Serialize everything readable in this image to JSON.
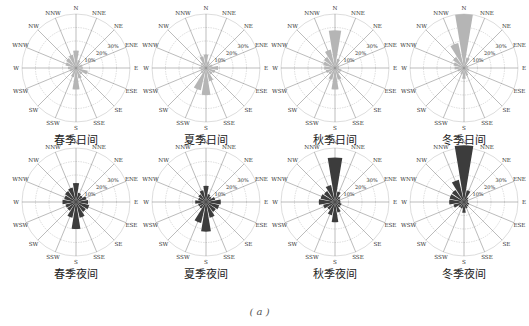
{
  "figure_label": "( a )",
  "colors": {
    "day": "#b5b5b5",
    "night": "#3c3c3c",
    "grid": "#bbbbbb",
    "axis": "#555555"
  },
  "chart_data": [
    {
      "type": "polar-bar",
      "title": "春季日间",
      "period": "day",
      "directions": [
        "N",
        "NNE",
        "NE",
        "ENE",
        "E",
        "ESE",
        "SE",
        "SSE",
        "S",
        "SSW",
        "SW",
        "WSW",
        "W",
        "WNW",
        "NW",
        "NNW"
      ],
      "values": [
        13,
        6,
        4,
        5,
        5,
        9,
        6,
        8,
        16,
        7,
        4,
        5,
        6,
        8,
        9,
        10
      ],
      "ring_labels": [
        "10%",
        "20%",
        "30%"
      ],
      "rmax": 40
    },
    {
      "type": "polar-bar",
      "title": "夏季日间",
      "period": "day",
      "directions": [
        "N",
        "NNE",
        "NE",
        "ENE",
        "E",
        "ESE",
        "SE",
        "SSE",
        "S",
        "SSW",
        "SW",
        "WSW",
        "W",
        "WNW",
        "NW",
        "NNW"
      ],
      "values": [
        10,
        5,
        4,
        5,
        9,
        7,
        6,
        10,
        20,
        17,
        5,
        4,
        5,
        4,
        5,
        9
      ],
      "ring_labels": [
        "10%",
        "20%",
        "30%"
      ],
      "rmax": 40
    },
    {
      "type": "polar-bar",
      "title": "秋季日间",
      "period": "day",
      "directions": [
        "N",
        "NNE",
        "NE",
        "ENE",
        "E",
        "ESE",
        "SE",
        "SSE",
        "S",
        "SSW",
        "SW",
        "WSW",
        "W",
        "WNW",
        "NW",
        "NNW"
      ],
      "values": [
        28,
        7,
        4,
        3,
        3,
        5,
        5,
        9,
        16,
        9,
        6,
        7,
        8,
        9,
        10,
        14
      ],
      "ring_labels": [
        "10%",
        "20%",
        "30%"
      ],
      "rmax": 40
    },
    {
      "type": "polar-bar",
      "title": "冬季日间",
      "period": "day",
      "directions": [
        "N",
        "NNE",
        "NE",
        "ENE",
        "E",
        "ESE",
        "SE",
        "SSE",
        "S",
        "SSW",
        "SW",
        "WSW",
        "W",
        "WNW",
        "NW",
        "NNW"
      ],
      "values": [
        40,
        8,
        3,
        3,
        3,
        4,
        4,
        6,
        8,
        5,
        4,
        5,
        7,
        8,
        10,
        19
      ],
      "ring_labels": [
        "10%",
        "20%",
        "30%"
      ],
      "rmax": 40
    },
    {
      "type": "polar-bar",
      "title": "春季夜间",
      "period": "night",
      "directions": [
        "N",
        "NNE",
        "NE",
        "ENE",
        "E",
        "ESE",
        "SE",
        "SSE",
        "S",
        "SSW",
        "SW",
        "WSW",
        "W",
        "WNW",
        "NW",
        "NNW"
      ],
      "values": [
        14,
        7,
        6,
        8,
        9,
        10,
        9,
        12,
        20,
        12,
        8,
        8,
        10,
        9,
        10,
        11
      ],
      "ring_labels": [
        "10%",
        "20%",
        "30%"
      ],
      "rmax": 40
    },
    {
      "type": "polar-bar",
      "title": "夏季夜间",
      "period": "night",
      "directions": [
        "N",
        "NNE",
        "NE",
        "ENE",
        "E",
        "ESE",
        "SE",
        "SSE",
        "S",
        "SSW",
        "SW",
        "WSW",
        "W",
        "WNW",
        "NW",
        "NNW"
      ],
      "values": [
        12,
        6,
        5,
        7,
        11,
        10,
        9,
        12,
        22,
        16,
        6,
        6,
        8,
        6,
        7,
        9
      ],
      "ring_labels": [
        "10%",
        "20%",
        "30%"
      ],
      "rmax": 40
    },
    {
      "type": "polar-bar",
      "title": "秋季夜间",
      "period": "night",
      "directions": [
        "N",
        "NNE",
        "NE",
        "ENE",
        "E",
        "ESE",
        "SE",
        "SSE",
        "S",
        "SSW",
        "SW",
        "WSW",
        "W",
        "WNW",
        "NW",
        "NNW"
      ],
      "values": [
        33,
        8,
        5,
        4,
        4,
        5,
        5,
        8,
        15,
        10,
        7,
        9,
        12,
        11,
        10,
        13
      ],
      "ring_labels": [
        "10%",
        "20%",
        "30%"
      ],
      "rmax": 40
    },
    {
      "type": "polar-bar",
      "title": "冬季夜间",
      "period": "night",
      "directions": [
        "N",
        "NNE",
        "NE",
        "ENE",
        "E",
        "ESE",
        "SE",
        "SSE",
        "S",
        "SSW",
        "SW",
        "WSW",
        "W",
        "WNW",
        "NW",
        "NNW"
      ],
      "values": [
        42,
        9,
        4,
        3,
        3,
        4,
        4,
        5,
        8,
        5,
        5,
        8,
        11,
        11,
        11,
        17
      ],
      "ring_labels": [
        "10%",
        "20%",
        "30%"
      ],
      "rmax": 40
    }
  ]
}
